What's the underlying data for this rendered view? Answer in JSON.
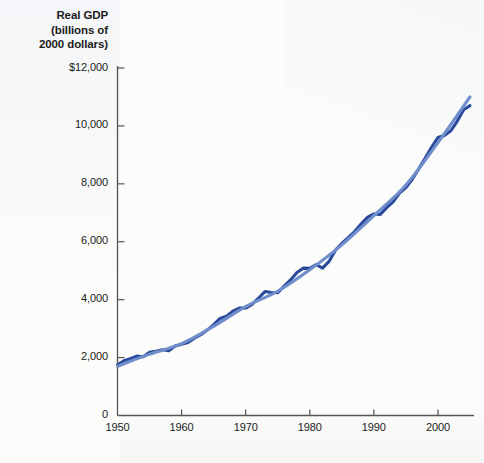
{
  "chart_data": {
    "type": "line",
    "title": "Real GDP (billions of 2000 dollars)",
    "title_lines": [
      "Real GDP",
      "(billions of",
      "2000 dollars)"
    ],
    "xlabel": "",
    "ylabel": "Real GDP (billions of 2000 dollars)",
    "xlim": [
      1950,
      2005
    ],
    "ylim": [
      0,
      12000
    ],
    "grid": false,
    "legend_position": "none",
    "x_ticks": [
      "1950",
      "1960",
      "1970",
      "1980",
      "1990",
      "2000"
    ],
    "x_tick_values": [
      1950,
      1960,
      1970,
      1980,
      1990,
      2000
    ],
    "y_ticks": [
      "0",
      "2,000",
      "4,000",
      "6,000",
      "8,000",
      "10,000",
      "$12,000"
    ],
    "y_tick_values": [
      0,
      2000,
      4000,
      6000,
      8000,
      10000,
      12000
    ],
    "colors": {
      "actual_line": "#2b4a9b",
      "trend_line": "#6f8ecb",
      "axis": "#555555",
      "text": "#1c1c1c",
      "background": "#fcfcfa"
    },
    "series": [
      {
        "name": "Real GDP",
        "style": "actual",
        "color": "#2b4a9b",
        "x": [
          1950,
          1951,
          1952,
          1953,
          1954,
          1955,
          1956,
          1957,
          1958,
          1959,
          1960,
          1961,
          1962,
          1963,
          1964,
          1965,
          1966,
          1967,
          1968,
          1969,
          1970,
          1971,
          1972,
          1973,
          1974,
          1975,
          1976,
          1977,
          1978,
          1979,
          1980,
          1981,
          1982,
          1983,
          1984,
          1985,
          1986,
          1987,
          1988,
          1989,
          1990,
          1991,
          1992,
          1993,
          1994,
          1995,
          1996,
          1997,
          1998,
          1999,
          2000,
          2001,
          2002,
          2003,
          2004,
          2005
        ],
        "values": [
          1750,
          1890,
          1960,
          2050,
          2030,
          2180,
          2220,
          2270,
          2240,
          2400,
          2460,
          2520,
          2670,
          2790,
          2950,
          3140,
          3350,
          3430,
          3600,
          3710,
          3710,
          3840,
          4050,
          4280,
          4250,
          4240,
          4470,
          4680,
          4940,
          5090,
          5080,
          5210,
          5090,
          5320,
          5710,
          5940,
          6140,
          6350,
          6610,
          6840,
          6960,
          6940,
          7180,
          7380,
          7680,
          7870,
          8160,
          8520,
          8880,
          9260,
          9600,
          9670,
          9830,
          10160,
          10560,
          10700
        ]
      },
      {
        "name": "Trend (potential) GDP",
        "style": "trend",
        "color": "#6f8ecb",
        "x": [
          1950,
          1955,
          1960,
          1965,
          1970,
          1975,
          1980,
          1985,
          1990,
          1995,
          2000,
          2005
        ],
        "values": [
          1700,
          2120,
          2480,
          3080,
          3760,
          4290,
          5030,
          5890,
          6900,
          7960,
          9420,
          11000
        ]
      }
    ]
  }
}
